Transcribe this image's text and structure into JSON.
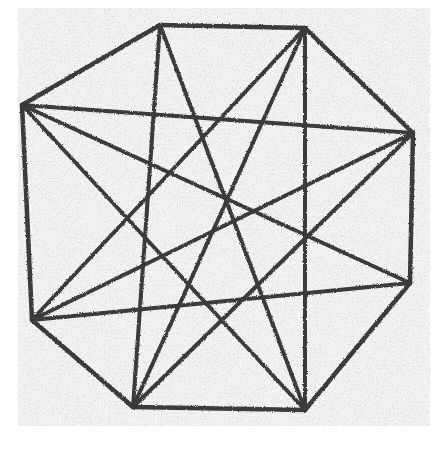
{
  "image": {
    "subject": "pencil drawing of an octagon with inscribed star pattern",
    "width": 443,
    "height": 453,
    "colors": {
      "background": "#ffffff",
      "paper": "#f4f4f4",
      "stroke": "#3a3a3a",
      "smudge": "#9a9a9a"
    },
    "paper_rect": {
      "x": 18,
      "y": 8,
      "width": 412,
      "height": 418
    },
    "vertices": [
      {
        "id": "V1",
        "x": 160,
        "y": 25
      },
      {
        "id": "V2",
        "x": 305,
        "y": 28
      },
      {
        "id": "V3",
        "x": 413,
        "y": 133
      },
      {
        "id": "V4",
        "x": 410,
        "y": 283
      },
      {
        "id": "V5",
        "x": 305,
        "y": 410
      },
      {
        "id": "V6",
        "x": 133,
        "y": 407
      },
      {
        "id": "V7",
        "x": 32,
        "y": 320
      },
      {
        "id": "V8",
        "x": 22,
        "y": 105
      }
    ],
    "outline_edges": [
      [
        "V1",
        "V2"
      ],
      [
        "V2",
        "V3"
      ],
      [
        "V3",
        "V4"
      ],
      [
        "V4",
        "V5"
      ],
      [
        "V5",
        "V6"
      ],
      [
        "V6",
        "V7"
      ],
      [
        "V7",
        "V8"
      ],
      [
        "V8",
        "V1"
      ]
    ],
    "interior_lines": [
      [
        "V1",
        "V6"
      ],
      [
        "V1",
        "V5"
      ],
      [
        "V2",
        "V5"
      ],
      [
        "V2",
        "V6"
      ],
      [
        "V2",
        "V7"
      ],
      [
        "V3",
        "V8"
      ],
      [
        "V3",
        "V7"
      ],
      [
        "V3",
        "V6"
      ],
      [
        "V4",
        "V8"
      ],
      [
        "V4",
        "V7"
      ],
      [
        "V8",
        "V5"
      ]
    ]
  }
}
